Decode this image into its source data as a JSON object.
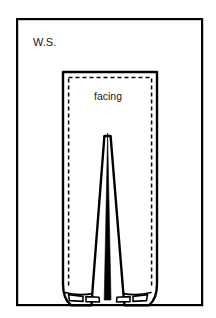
{
  "figure": {
    "type": "sewing-pattern-illustration",
    "background_color": "#ffffff",
    "line_color": "#000000",
    "text_color": "#1a1a1a"
  },
  "frame": {
    "name": "illustration-border",
    "x": 16,
    "y": 18,
    "width": 187,
    "height": 288,
    "stroke": "#000000"
  },
  "labels": {
    "wrong_side": "W.S.",
    "wrong_side_x": 33,
    "wrong_side_y": 46,
    "facing": "facing",
    "facing_x": 108,
    "facing_y": 100
  },
  "garment": {
    "name": "trousers-outline",
    "top_y": 72,
    "left_x": 63,
    "right_x": 157,
    "bottom_y": 306,
    "outline_path": "M 63 72 L 157 72 L 157 285 Q 157 300 150 305 L 124 305 L 124 290 L 110 135 L 105 135 L 92 290 L 92 305 L 70 305 Q 63 300 63 285 Z",
    "stitch_path": "M 68.5 77.5 L 151.5 77.5 L 151.5 286 M 68.5 77.5 L 68.5 286"
  },
  "center_seam": {
    "name": "crotch-inseam-wedge",
    "apex_y": 133,
    "bottom_y": 300,
    "path": "M 107.5 133 L 110.8 300 L 106.5 300 L 104.2 300 L 104.6 300 Z"
  },
  "hems": [
    {
      "name": "left-leg-hem",
      "cuff_x": 66,
      "cuff_y": 291,
      "cuff_width": 26,
      "cuff_height": 9
    },
    {
      "name": "right-leg-hem",
      "cuff_x": 124,
      "cuff_y": 291,
      "cuff_width": 26,
      "cuff_height": 9
    }
  ]
}
